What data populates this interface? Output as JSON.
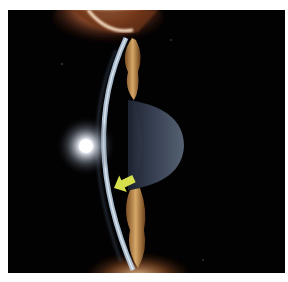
{
  "image": {
    "description": "Slit-lamp photograph of the anterior segment of an eye showing the corneal optical section, iris and lens, with an annotation arrow",
    "annotation": {
      "type": "arrow",
      "direction": "down-left",
      "color": "#d6e04c"
    },
    "colors": {
      "background": "#020203",
      "cornea_beam": "#a9c2da",
      "iris": "#b98a4a",
      "lens": "#3b4556",
      "eyelid": "#8a4a26",
      "frame": "#ffffff"
    }
  }
}
